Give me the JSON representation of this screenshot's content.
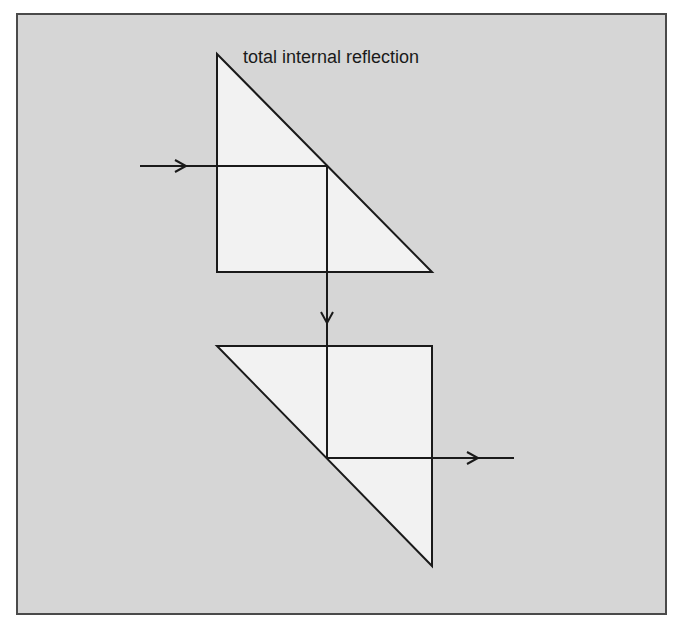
{
  "diagram": {
    "annotation": "total internal reflection",
    "colors": {
      "background": "#d6d6d6",
      "prism_fill": "#f2f2f2",
      "stroke": "#1a1a1a",
      "frame_border": "#4a4a4a"
    },
    "prisms": [
      {
        "name": "upper-prism",
        "points": [
          [
            217,
            54
          ],
          [
            217,
            272
          ],
          [
            432,
            272
          ]
        ]
      },
      {
        "name": "lower-prism",
        "points": [
          [
            217,
            346
          ],
          [
            432,
            346
          ],
          [
            432,
            566
          ]
        ]
      }
    ],
    "ray": {
      "path": [
        [
          140,
          166
        ],
        [
          327,
          166
        ],
        [
          327,
          458
        ],
        [
          514,
          458
        ]
      ],
      "arrows": [
        "right-at-entry",
        "down-between-prisms",
        "right-at-exit"
      ]
    }
  }
}
